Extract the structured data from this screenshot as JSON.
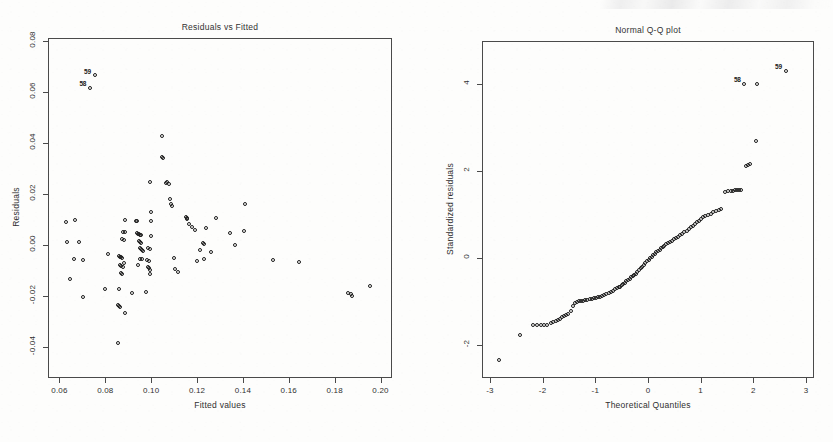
{
  "figure": {
    "panels": [
      "residuals-vs-fitted",
      "normal-qq-plot"
    ],
    "background_color": "#fdfdfc",
    "ink_color": "#1d1d1d",
    "axis_color": "#4a4a4a"
  },
  "chart_data": [
    {
      "type": "scatter",
      "id": "residuals-vs-fitted",
      "title": "Residuals vs Fitted",
      "xlabel": "Fitted values",
      "ylabel": "Residuals",
      "xlim": [
        0.055,
        0.205
      ],
      "ylim": [
        -0.052,
        0.081
      ],
      "xticks": [
        0.06,
        0.08,
        0.1,
        0.12,
        0.14,
        0.16,
        0.18,
        0.2
      ],
      "xticklabels": [
        "0.06",
        "0.08",
        "0.10",
        "0.12",
        "0.14",
        "0.16",
        "0.18",
        "0.20"
      ],
      "yticks": [
        -0.04,
        -0.02,
        0.0,
        0.02,
        0.04,
        0.06,
        0.08
      ],
      "yticklabels": [
        "-0.04",
        "-0.02",
        "0.00",
        "0.02",
        "0.04",
        "0.06",
        "0.08"
      ],
      "grid": false,
      "legend": "none",
      "marker": "open-circle",
      "annotations": [
        {
          "label": "59",
          "x": 0.0755,
          "y": 0.0663
        },
        {
          "label": "58",
          "x": 0.0735,
          "y": 0.0613
        }
      ],
      "points": [
        [
          0.0755,
          0.0663
        ],
        [
          0.0735,
          0.0613
        ],
        [
          0.1048,
          0.0425
        ],
        [
          0.1053,
          0.0338
        ],
        [
          0.105,
          0.0342
        ],
        [
          0.0995,
          0.0243
        ],
        [
          0.1065,
          0.024
        ],
        [
          0.1072,
          0.0244
        ],
        [
          0.108,
          0.0238
        ],
        [
          0.1085,
          0.018
        ],
        [
          0.109,
          0.0158
        ],
        [
          0.1094,
          0.0152
        ],
        [
          0.141,
          0.0157
        ],
        [
          0.1,
          0.0128
        ],
        [
          0.1152,
          0.0108
        ],
        [
          0.1157,
          0.0104
        ],
        [
          0.116,
          0.0099
        ],
        [
          0.1283,
          0.0105
        ],
        [
          0.0888,
          0.0095
        ],
        [
          0.0935,
          0.0093
        ],
        [
          0.094,
          0.0091
        ],
        [
          0.063,
          0.0089
        ],
        [
          0.0672,
          0.0095
        ],
        [
          0.1002,
          0.0092
        ],
        [
          0.1168,
          0.008
        ],
        [
          0.118,
          0.007
        ],
        [
          0.1195,
          0.0058
        ],
        [
          0.124,
          0.0064
        ],
        [
          0.0878,
          0.005
        ],
        [
          0.0888,
          0.0048
        ],
        [
          0.094,
          0.0044
        ],
        [
          0.0945,
          0.0042
        ],
        [
          0.095,
          0.004
        ],
        [
          0.0955,
          0.0038
        ],
        [
          0.0958,
          0.0036
        ],
        [
          0.1345,
          0.0046
        ],
        [
          0.1408,
          0.0053
        ],
        [
          0.0876,
          0.0022
        ],
        [
          0.0882,
          0.0018
        ],
        [
          0.0948,
          0.0014
        ],
        [
          0.0952,
          0.001
        ],
        [
          0.0956,
          0.0008
        ],
        [
          0.1002,
          0.0032
        ],
        [
          0.0635,
          0.001
        ],
        [
          0.0688,
          0.0012
        ],
        [
          0.1228,
          0.0005
        ],
        [
          0.1232,
          0.0002
        ],
        [
          0.1368,
          0.0
        ],
        [
          0.0953,
          -0.0013
        ],
        [
          0.0958,
          -0.0016
        ],
        [
          0.0962,
          -0.0022
        ],
        [
          0.0966,
          -0.0026
        ],
        [
          0.099,
          -0.0013
        ],
        [
          0.0995,
          -0.0018
        ],
        [
          0.1215,
          -0.0022
        ],
        [
          0.1262,
          -0.003
        ],
        [
          0.0812,
          -0.0035
        ],
        [
          0.0862,
          -0.0046
        ],
        [
          0.0868,
          -0.0048
        ],
        [
          0.0872,
          -0.005
        ],
        [
          0.0876,
          -0.0054
        ],
        [
          0.0955,
          -0.0055
        ],
        [
          0.096,
          -0.0058
        ],
        [
          0.0986,
          -0.006
        ],
        [
          0.0992,
          -0.0064
        ],
        [
          0.11,
          -0.0052
        ],
        [
          0.0665,
          -0.0055
        ],
        [
          0.0705,
          -0.0062
        ],
        [
          0.1202,
          -0.0065
        ],
        [
          0.1232,
          -0.0058
        ],
        [
          0.1532,
          -0.0062
        ],
        [
          0.1645,
          -0.007
        ],
        [
          0.0866,
          -0.008
        ],
        [
          0.087,
          -0.0084
        ],
        [
          0.0878,
          -0.0088
        ],
        [
          0.0884,
          -0.0072
        ],
        [
          0.0946,
          -0.0078
        ],
        [
          0.0988,
          -0.0088
        ],
        [
          0.0992,
          -0.0092
        ],
        [
          0.0996,
          -0.01
        ],
        [
          0.1108,
          -0.0095
        ],
        [
          0.1118,
          -0.0108
        ],
        [
          0.087,
          -0.0112
        ],
        [
          0.0874,
          -0.0116
        ],
        [
          0.0996,
          -0.0115
        ],
        [
          0.0648,
          -0.0135
        ],
        [
          0.08,
          -0.0175
        ],
        [
          0.086,
          -0.0175
        ],
        [
          0.092,
          -0.019
        ],
        [
          0.0978,
          -0.0185
        ],
        [
          0.0706,
          -0.0205
        ],
        [
          0.1862,
          -0.0188
        ],
        [
          0.1872,
          -0.0192
        ],
        [
          0.1878,
          -0.0202
        ],
        [
          0.1955,
          -0.0163
        ],
        [
          0.0858,
          -0.0238
        ],
        [
          0.0862,
          -0.0242
        ],
        [
          0.0866,
          -0.0246
        ],
        [
          0.0888,
          -0.0268
        ],
        [
          0.0858,
          -0.0385
        ]
      ]
    },
    {
      "type": "scatter",
      "id": "normal-qq-plot",
      "title": "Normal Q-Q plot",
      "xlabel": "Theoretical Quantiles",
      "ylabel": "Standardized residuals",
      "xlim": [
        -3.15,
        3.15
      ],
      "ylim": [
        -2.75,
        5.0
      ],
      "xticks": [
        -3,
        -2,
        -1,
        0,
        1,
        2,
        3
      ],
      "xticklabels": [
        "-3",
        "-2",
        "-1",
        "0",
        "1",
        "2",
        "3"
      ],
      "yticks": [
        -2,
        0,
        2,
        4
      ],
      "yticklabels": [
        "-2",
        "0",
        "2",
        "4"
      ],
      "grid": false,
      "legend": "none",
      "marker": "open-circle",
      "annotations": [
        {
          "label": "59",
          "x": 2.62,
          "y": 4.3
        },
        {
          "label": "58",
          "x": 1.84,
          "y": 4.0
        }
      ],
      "points": [
        [
          -2.82,
          -2.35
        ],
        [
          -2.42,
          -1.78
        ],
        [
          -2.18,
          -1.55
        ],
        [
          -2.1,
          -1.55
        ],
        [
          -2.03,
          -1.55
        ],
        [
          -1.96,
          -1.55
        ],
        [
          -1.9,
          -1.54
        ],
        [
          -1.84,
          -1.5
        ],
        [
          -1.79,
          -1.47
        ],
        [
          -1.74,
          -1.44
        ],
        [
          -1.7,
          -1.42
        ],
        [
          -1.66,
          -1.4
        ],
        [
          -1.62,
          -1.37
        ],
        [
          -1.58,
          -1.34
        ],
        [
          -1.54,
          -1.31
        ],
        [
          -1.5,
          -1.28
        ],
        [
          -1.46,
          -1.22
        ],
        [
          -1.42,
          -1.1
        ],
        [
          -1.38,
          -1.04
        ],
        [
          -1.34,
          -1.02
        ],
        [
          -1.3,
          -1.0
        ],
        [
          -1.26,
          -0.99
        ],
        [
          -1.22,
          -0.98
        ],
        [
          -1.18,
          -0.97
        ],
        [
          -1.14,
          -0.96
        ],
        [
          -1.1,
          -0.95
        ],
        [
          -1.06,
          -0.94
        ],
        [
          -1.02,
          -0.93
        ],
        [
          -0.98,
          -0.92
        ],
        [
          -0.94,
          -0.9
        ],
        [
          -0.9,
          -0.89
        ],
        [
          -0.86,
          -0.87
        ],
        [
          -0.82,
          -0.86
        ],
        [
          -0.78,
          -0.84
        ],
        [
          -0.74,
          -0.8
        ],
        [
          -0.7,
          -0.78
        ],
        [
          -0.66,
          -0.75
        ],
        [
          -0.62,
          -0.72
        ],
        [
          -0.58,
          -0.7
        ],
        [
          -0.55,
          -0.68
        ],
        [
          -0.52,
          -0.66
        ],
        [
          -0.49,
          -0.63
        ],
        [
          -0.46,
          -0.6
        ],
        [
          -0.43,
          -0.57
        ],
        [
          -0.4,
          -0.54
        ],
        [
          -0.37,
          -0.51
        ],
        [
          -0.34,
          -0.48
        ],
        [
          -0.31,
          -0.45
        ],
        [
          -0.28,
          -0.42
        ],
        [
          -0.25,
          -0.39
        ],
        [
          -0.22,
          -0.36
        ],
        [
          -0.19,
          -0.32
        ],
        [
          -0.16,
          -0.28
        ],
        [
          -0.13,
          -0.24
        ],
        [
          -0.1,
          -0.2
        ],
        [
          -0.07,
          -0.16
        ],
        [
          -0.04,
          -0.12
        ],
        [
          -0.01,
          -0.08
        ],
        [
          0.02,
          -0.04
        ],
        [
          0.05,
          0.0
        ],
        [
          0.08,
          0.03
        ],
        [
          0.11,
          0.07
        ],
        [
          0.14,
          0.1
        ],
        [
          0.17,
          0.13
        ],
        [
          0.2,
          0.16
        ],
        [
          0.23,
          0.19
        ],
        [
          0.26,
          0.22
        ],
        [
          0.29,
          0.25
        ],
        [
          0.32,
          0.28
        ],
        [
          0.35,
          0.31
        ],
        [
          0.38,
          0.34
        ],
        [
          0.42,
          0.37
        ],
        [
          0.46,
          0.4
        ],
        [
          0.5,
          0.43
        ],
        [
          0.54,
          0.46
        ],
        [
          0.58,
          0.49
        ],
        [
          0.62,
          0.52
        ],
        [
          0.66,
          0.56
        ],
        [
          0.7,
          0.59
        ],
        [
          0.74,
          0.62
        ],
        [
          0.78,
          0.66
        ],
        [
          0.82,
          0.7
        ],
        [
          0.86,
          0.74
        ],
        [
          0.9,
          0.78
        ],
        [
          0.94,
          0.82
        ],
        [
          0.98,
          0.86
        ],
        [
          1.02,
          0.9
        ],
        [
          1.06,
          0.93
        ],
        [
          1.1,
          0.96
        ],
        [
          1.15,
          0.99
        ],
        [
          1.2,
          1.02
        ],
        [
          1.25,
          1.05
        ],
        [
          1.3,
          1.08
        ],
        [
          1.35,
          1.1
        ],
        [
          1.4,
          1.12
        ],
        [
          1.47,
          1.52
        ],
        [
          1.53,
          1.54
        ],
        [
          1.58,
          1.55
        ],
        [
          1.62,
          1.55
        ],
        [
          1.66,
          1.56
        ],
        [
          1.7,
          1.56
        ],
        [
          1.74,
          1.57
        ],
        [
          1.78,
          1.57
        ],
        [
          1.86,
          2.12
        ],
        [
          1.91,
          2.14
        ],
        [
          1.95,
          2.15
        ],
        [
          2.05,
          2.68
        ],
        [
          1.84,
          4.0
        ],
        [
          2.07,
          4.0
        ],
        [
          2.62,
          4.3
        ]
      ]
    }
  ]
}
